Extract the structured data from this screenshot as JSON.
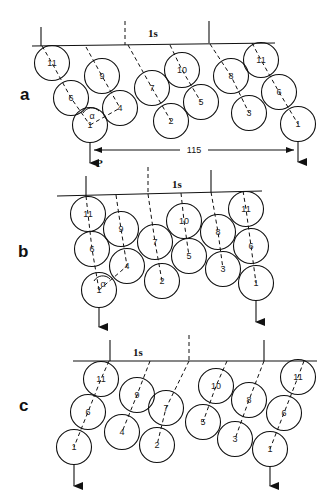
{
  "figure": {
    "panels": [
      {
        "label": "a",
        "label_pos": [
          20,
          100
        ],
        "top_line": {
          "x1": 32,
          "y1": 46,
          "x2": 275,
          "y2": 43,
          "text": "1s",
          "text_pos": [
            148,
            37
          ]
        },
        "ticks": [
          {
            "x1": 41,
            "y1": 27,
            "x2": 41,
            "y2": 46,
            "dashed": false
          },
          {
            "x1": 125,
            "y1": 21,
            "x2": 125,
            "y2": 45,
            "dashed": true
          },
          {
            "x1": 209,
            "y1": 21,
            "x2": 209,
            "y2": 43,
            "dashed": false
          }
        ],
        "circles": [
          {
            "n": "11",
            "x": 52,
            "y": 63
          },
          {
            "n": "6",
            "x": 71,
            "y": 98
          },
          {
            "n": "1",
            "x": 90,
            "y": 125
          },
          {
            "n": "9",
            "x": 102,
            "y": 76
          },
          {
            "n": "4",
            "x": 120,
            "y": 108
          },
          {
            "n": "7",
            "x": 152,
            "y": 88
          },
          {
            "n": "2",
            "x": 171,
            "y": 121
          },
          {
            "n": "10",
            "x": 182,
            "y": 70
          },
          {
            "n": "5",
            "x": 201,
            "y": 102
          },
          {
            "n": "8",
            "x": 231,
            "y": 76
          },
          {
            "n": "3",
            "x": 249,
            "y": 113
          },
          {
            "n": "11",
            "x": 261,
            "y": 60
          },
          {
            "n": "6",
            "x": 279,
            "y": 92
          },
          {
            "n": "1",
            "x": 298,
            "y": 124
          }
        ],
        "chains": [
          [
            [
              42,
              46
            ],
            [
              52,
              63
            ],
            [
              71,
              98
            ],
            [
              90,
              125
            ]
          ],
          [
            [
              86,
              47
            ],
            [
              102,
              76
            ],
            [
              120,
              108
            ]
          ],
          [
            [
              128,
              45
            ],
            [
              152,
              88
            ],
            [
              171,
              121
            ]
          ],
          [
            [
              170,
              45
            ],
            [
              182,
              70
            ],
            [
              201,
              102
            ]
          ],
          [
            [
              210,
              44
            ],
            [
              231,
              76
            ],
            [
              249,
              113
            ]
          ],
          [
            [
              252,
              43
            ],
            [
              261,
              60
            ],
            [
              279,
              92
            ],
            [
              298,
              124
            ]
          ]
        ],
        "alpha_line": [
          [
            90,
            125
          ],
          [
            120,
            108
          ]
        ],
        "alpha_label": "α",
        "alpha_pos": [
          89,
          115
        ],
        "arrows": [
          {
            "x": 90,
            "y1": 142,
            "y2": 163
          },
          {
            "x": 298,
            "y1": 141,
            "y2": 162
          }
        ],
        "load_label": "P",
        "load_label_pos": [
          96,
          167
        ],
        "dimension": {
          "text": "115",
          "x1": 94,
          "x2": 294,
          "y": 150,
          "text_x": 194
        }
      },
      {
        "label": "b",
        "label_pos": [
          18,
          257
        ],
        "top_line": {
          "x1": 57,
          "y1": 196,
          "x2": 262,
          "y2": 191,
          "text": "1s",
          "text_pos": [
            172,
            188
          ]
        },
        "ticks": [
          {
            "x1": 86,
            "y1": 176,
            "x2": 86,
            "y2": 196,
            "dashed": false
          },
          {
            "x1": 148,
            "y1": 167,
            "x2": 148,
            "y2": 194,
            "dashed": true
          },
          {
            "x1": 211,
            "y1": 170,
            "x2": 211,
            "y2": 192,
            "dashed": false
          }
        ],
        "circles": [
          {
            "n": "11",
            "x": 88,
            "y": 214
          },
          {
            "n": "6",
            "x": 92,
            "y": 249
          },
          {
            "n": "1",
            "x": 99,
            "y": 290
          },
          {
            "n": "9",
            "x": 121,
            "y": 229
          },
          {
            "n": "4",
            "x": 127,
            "y": 266
          },
          {
            "n": "7",
            "x": 155,
            "y": 242
          },
          {
            "n": "2",
            "x": 162,
            "y": 281
          },
          {
            "n": "10",
            "x": 184,
            "y": 221
          },
          {
            "n": "5",
            "x": 189,
            "y": 256
          },
          {
            "n": "8",
            "x": 218,
            "y": 232
          },
          {
            "n": "3",
            "x": 223,
            "y": 269
          },
          {
            "n": "11",
            "x": 246,
            "y": 209
          },
          {
            "n": "6",
            "x": 251,
            "y": 246
          },
          {
            "n": "1",
            "x": 256,
            "y": 283
          }
        ],
        "chains": [
          [
            [
              86,
              196
            ],
            [
              88,
              214
            ],
            [
              92,
              249
            ],
            [
              99,
              290
            ]
          ],
          [
            [
              116,
              195
            ],
            [
              121,
              229
            ],
            [
              127,
              266
            ]
          ],
          [
            [
              148,
              194
            ],
            [
              155,
              242
            ],
            [
              162,
              281
            ]
          ],
          [
            [
              181,
              193
            ],
            [
              184,
              221
            ],
            [
              189,
              256
            ]
          ],
          [
            [
              211,
              192
            ],
            [
              218,
              232
            ],
            [
              223,
              269
            ]
          ],
          [
            [
              243,
              191
            ],
            [
              246,
              209
            ],
            [
              251,
              246
            ],
            [
              256,
              283
            ]
          ]
        ],
        "alpha_line": [
          [
            99,
            290
          ],
          [
            127,
            266
          ]
        ],
        "alpha_label": "α",
        "alpha_pos": [
          100,
          283
        ],
        "arrows": [
          {
            "x": 99,
            "y1": 307,
            "y2": 327
          },
          {
            "x": 256,
            "y1": 300,
            "y2": 322
          }
        ],
        "load_label": "",
        "load_label_pos": [
          0,
          0
        ],
        "dimension": null
      },
      {
        "label": "c",
        "label_pos": [
          19,
          411
        ],
        "top_line": {
          "x1": 73,
          "y1": 361,
          "x2": 317,
          "y2": 361,
          "text": "1s",
          "text_pos": [
            133,
            356
          ]
        },
        "ticks": [
          {
            "x1": 110,
            "y1": 340,
            "x2": 110,
            "y2": 361,
            "dashed": false
          },
          {
            "x1": 189,
            "y1": 335,
            "x2": 189,
            "y2": 361,
            "dashed": true
          },
          {
            "x1": 264,
            "y1": 340,
            "x2": 264,
            "y2": 361,
            "dashed": false
          }
        ],
        "circles": [
          {
            "n": "11",
            "x": 101,
            "y": 379
          },
          {
            "n": "6",
            "x": 88,
            "y": 412
          },
          {
            "n": "1",
            "x": 74,
            "y": 447
          },
          {
            "n": "9",
            "x": 137,
            "y": 395
          },
          {
            "n": "4",
            "x": 122,
            "y": 432
          },
          {
            "n": "7",
            "x": 166,
            "y": 408
          },
          {
            "n": "2",
            "x": 157,
            "y": 445
          },
          {
            "n": "10",
            "x": 216,
            "y": 386
          },
          {
            "n": "5",
            "x": 203,
            "y": 422
          },
          {
            "n": "8",
            "x": 249,
            "y": 400
          },
          {
            "n": "3",
            "x": 235,
            "y": 439
          },
          {
            "n": "11",
            "x": 298,
            "y": 377
          },
          {
            "n": "6",
            "x": 284,
            "y": 413
          },
          {
            "n": "1",
            "x": 270,
            "y": 449
          }
        ],
        "chains": [
          [
            [
              109,
              361
            ],
            [
              101,
              379
            ],
            [
              88,
              412
            ],
            [
              74,
              447
            ]
          ],
          [
            [
              150,
              361
            ],
            [
              137,
              395
            ],
            [
              122,
              432
            ]
          ],
          [
            [
              189,
              361
            ],
            [
              166,
              408
            ],
            [
              157,
              445
            ]
          ],
          [
            [
              227,
              361
            ],
            [
              216,
              386
            ],
            [
              203,
              422
            ]
          ],
          [
            [
              264,
              361
            ],
            [
              249,
              400
            ],
            [
              235,
              439
            ]
          ],
          [
            [
              304,
              361
            ],
            [
              298,
              377
            ],
            [
              284,
              413
            ],
            [
              270,
              449
            ]
          ]
        ],
        "alpha_line": null,
        "alpha_label": "",
        "alpha_pos": [
          0,
          0
        ],
        "arrows": [
          {
            "x": 74,
            "y1": 464,
            "y2": 486
          },
          {
            "x": 270,
            "y1": 466,
            "y2": 486
          }
        ],
        "load_label": "",
        "load_label_pos": [
          0,
          0
        ],
        "dimension": null
      }
    ],
    "circle_radius": 17.5
  }
}
